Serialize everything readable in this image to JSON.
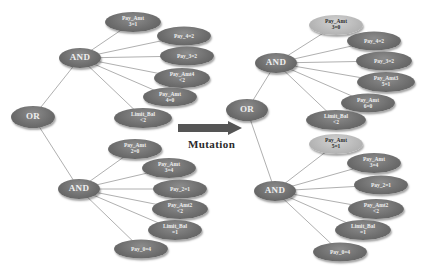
{
  "diagram": {
    "arrow_label": "Mutation",
    "colors": {
      "dark_node": "#6c6c6c",
      "light_node": "#b7b7b7",
      "edge": "#b0b0b0",
      "arrow": "#555555"
    },
    "before": {
      "root": "OR",
      "and_top": "AND",
      "and_bottom": "AND",
      "top_children": [
        "Pay_Amt\n3=1",
        "Pay_4=2",
        "Pay_3=2",
        "Pay_Amt4\n<2",
        "Pay_Amt\n4=0",
        "Limit_Bal\n<2"
      ],
      "bottom_children": [
        "Pay_Amt\n2=0",
        "Pay_Amt\n3=4",
        "Pay_2=1",
        "Pay_Amt2\n<2",
        "Limit_Bal\n=1",
        "Pay_0=4"
      ]
    },
    "after": {
      "root": "OR",
      "and_top": "AND",
      "and_bottom": "AND",
      "top_children": [
        "Pay_Amt\n3=0",
        "Pay_4=2",
        "Pay_3=2",
        "Pay_Amt3\n5=1",
        "Pay_Amt\n6=0",
        "Limit_Bal\n<2"
      ],
      "bottom_children": [
        "Pay_Amt\n5=1",
        "Pay_Amt\n3=4",
        "Pay_2=1",
        "Pay_Amt2\n<2",
        "Limit_Bal\n=1",
        "Pay_0=4"
      ]
    }
  }
}
